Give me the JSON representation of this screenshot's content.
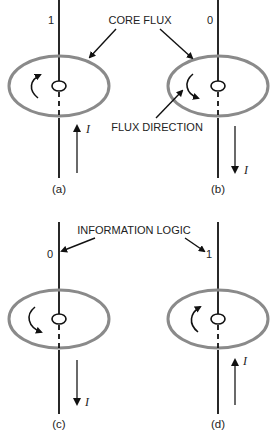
{
  "diagram": {
    "labels": {
      "core_flux": "CORE FLUX",
      "flux_direction": "FLUX DIRECTION",
      "information_logic": "INFORMATION LOGIC"
    },
    "cores": [
      {
        "id": "a",
        "caption": "(a)",
        "bit": "1",
        "current_label": "I",
        "current_direction": "up",
        "flux_direction": "counterclockwise"
      },
      {
        "id": "b",
        "caption": "(b)",
        "bit": "0",
        "current_label": "I",
        "current_direction": "down",
        "flux_direction": "clockwise"
      },
      {
        "id": "c",
        "caption": "(c)",
        "bit": "0",
        "current_label": "I",
        "current_direction": "down",
        "flux_direction": "clockwise"
      },
      {
        "id": "d",
        "caption": "(d)",
        "bit": "1",
        "current_label": "I",
        "current_direction": "up",
        "flux_direction": "counterclockwise"
      }
    ]
  }
}
